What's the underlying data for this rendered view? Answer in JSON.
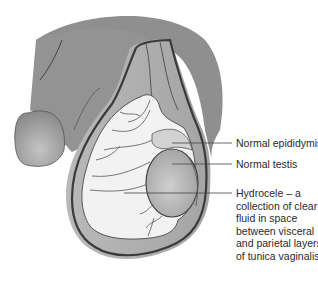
{
  "figure": {
    "labels": [
      {
        "id": "epididymis",
        "text": "Normal epididymis"
      },
      {
        "id": "testis",
        "text": "Normal testis"
      },
      {
        "id": "hydrocele",
        "lines": [
          "Hydrocele – a",
          "collection of clear",
          "fluid in space",
          "between visceral",
          "and parietal layers",
          "of tunica vaginalis"
        ]
      }
    ]
  },
  "colors": {
    "skin": "#8f8f8f",
    "skin_light": "#a8a8a8",
    "fluid": "#f1f1f1",
    "testis": "#b4b4b4",
    "outline": "#3a3a3a",
    "leader": "#444444",
    "text": "#2a2a2a"
  }
}
